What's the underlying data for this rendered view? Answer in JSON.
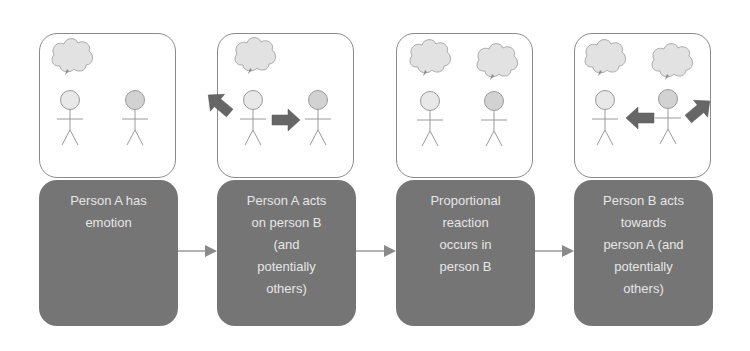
{
  "diagram": {
    "type": "flow",
    "colors": {
      "step_fill": "#757575",
      "step_text": "#e6e6e6",
      "scene_border": "#8a8a8a",
      "arrow": "#6a6a6a",
      "connector": "#9a9a9a",
      "head_a": "#e4e4e4",
      "head_b": "#cfcfcf",
      "cloud": "#e2e2e2"
    },
    "steps": [
      {
        "label": "Person A has\nemotion",
        "scene": {
          "thought_a": true,
          "thought_b": false,
          "arrows": []
        }
      },
      {
        "label": "Person A acts\non person B\n(and\npotentially\nothers)",
        "scene": {
          "thought_a": true,
          "thought_b": false,
          "arrows": [
            "A→B",
            "A→outside (up-left)"
          ]
        }
      },
      {
        "label": "Proportional\nreaction\noccurs in\nperson B",
        "scene": {
          "thought_a": true,
          "thought_b": true,
          "arrows": []
        }
      },
      {
        "label": "Person B acts\ntowards\nperson A (and\npotentially\nothers)",
        "scene": {
          "thought_a": true,
          "thought_b": true,
          "arrows": [
            "B→A",
            "B→outside (up-right)"
          ]
        }
      }
    ],
    "connectors": [
      {
        "from": 0,
        "to": 1
      },
      {
        "from": 1,
        "to": 2
      },
      {
        "from": 2,
        "to": 3
      }
    ]
  }
}
